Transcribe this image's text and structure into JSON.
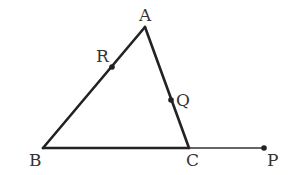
{
  "diagram": {
    "type": "geometry",
    "stroke_color": "#222222",
    "points": {
      "A": {
        "label": "A",
        "x": 145,
        "y": 27
      },
      "B": {
        "label": "B",
        "x": 43,
        "y": 148
      },
      "C": {
        "label": "C",
        "x": 189,
        "y": 148
      },
      "P": {
        "label": "P",
        "x": 264,
        "y": 148
      },
      "R": {
        "label": "R",
        "x": 112,
        "y": 67
      },
      "Q": {
        "label": "Q",
        "x": 171,
        "y": 100
      }
    },
    "segments": [
      {
        "from": "A",
        "to": "B"
      },
      {
        "from": "A",
        "to": "C"
      },
      {
        "from": "B",
        "to": "C"
      },
      {
        "from": "C",
        "to": "P"
      }
    ],
    "marked_points": [
      "R",
      "Q",
      "P"
    ]
  }
}
